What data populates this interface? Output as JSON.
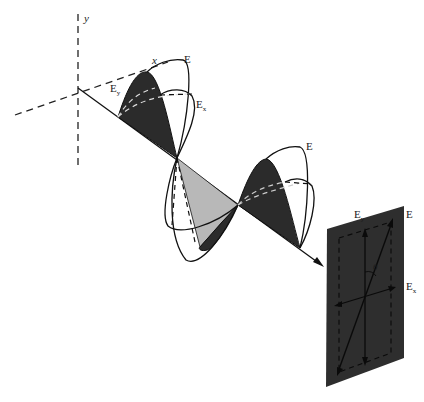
{
  "figure": {
    "axes": {
      "y_label": "y",
      "x_label": "x"
    },
    "wave_labels": {
      "resultant_1": "E",
      "component_y_1": "E",
      "component_y_1_sub": "y",
      "component_x_1": "E",
      "component_x_1_sub": "x",
      "resultant_2": "E"
    },
    "panel_labels": {
      "component_y": "E",
      "component_y_sub": "y",
      "resultant": "E",
      "angle": "θ",
      "component_x": "E",
      "component_x_sub": "x"
    },
    "colors": {
      "dark_fill": "#2b2b2b",
      "light_fill": "#b8b8b8",
      "panel_fill": "#2e2e2e",
      "stroke": "#111111",
      "background": "#ffffff"
    }
  }
}
